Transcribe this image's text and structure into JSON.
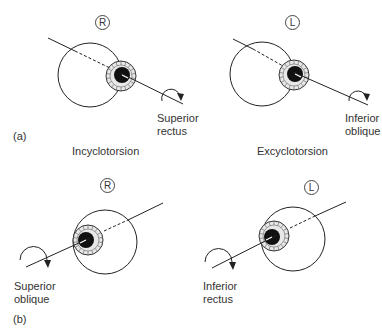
{
  "panels": {
    "a": {
      "label": "(a)",
      "right_eye": {
        "side": "R",
        "muscle_line1": "Superior",
        "muscle_line2": "rectus",
        "caption": "Incyclotorsion"
      },
      "left_eye": {
        "side": "L",
        "muscle_line1": "Inferior",
        "muscle_line2": "oblique",
        "caption": "Excyclotorsion"
      }
    },
    "b": {
      "label": "(b)",
      "right_eye": {
        "side": "R",
        "muscle_line1": "Superior",
        "muscle_line2": "oblique"
      },
      "left_eye": {
        "side": "L",
        "muscle_line1": "Inferior",
        "muscle_line2": "rectus"
      }
    }
  },
  "colors": {
    "line": "#222222",
    "pupil": "#111111",
    "iris_hatch": "#555555"
  }
}
